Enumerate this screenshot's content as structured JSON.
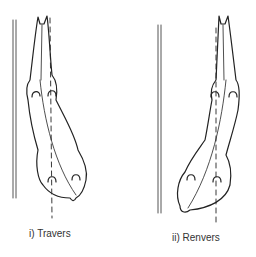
{
  "figure": {
    "panels": [
      {
        "id": "travers",
        "label": "i)  Travers"
      },
      {
        "id": "renvers",
        "label": "ii)  Renvers"
      }
    ],
    "colors": {
      "ink": "#222222",
      "background": "#ffffff"
    }
  }
}
